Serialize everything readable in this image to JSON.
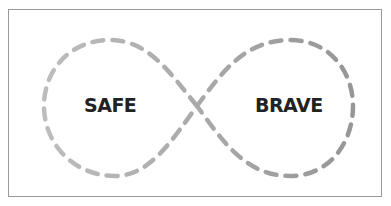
{
  "diagram": {
    "type": "infinity-loop",
    "left_label": "SAFE",
    "right_label": "BRAVE",
    "colors": {
      "left_loop": "#b9b9b9",
      "right_loop": "#9a9a9a",
      "text": "#222222",
      "border": "#9a9a9a"
    }
  }
}
